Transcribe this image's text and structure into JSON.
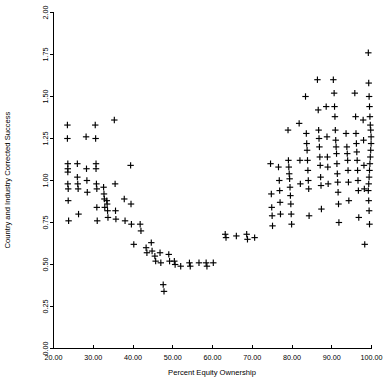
{
  "chart_data": {
    "type": "scatter",
    "title": "",
    "xlabel": "Percent Equity Ownership",
    "ylabel": "Country and Industry Corrected Success",
    "xlim": [
      20.0,
      100.0
    ],
    "ylim": [
      0.0,
      2.0
    ],
    "xticks": [
      20.0,
      30.0,
      40.0,
      50.0,
      60.0,
      70.0,
      80.0,
      90.0,
      100.0
    ],
    "yticks": [
      0.0,
      0.25,
      0.5,
      0.75,
      1.0,
      1.25,
      1.5,
      1.75,
      2.0
    ],
    "xtick_labels": [
      "20.00",
      "30.00",
      "40.00",
      "50.00",
      "60.00",
      "70.00",
      "80.00",
      "90.00",
      "100.00"
    ],
    "ytick_labels": [
      "0.00",
      "0.25",
      "0.50",
      "0.75",
      "1.00",
      "1.25",
      "1.50",
      "1.75",
      "2.00"
    ],
    "grid": false,
    "legend": null,
    "marker": "plus",
    "marker_color": "#000000",
    "points": [
      [
        23.5,
        1.33
      ],
      [
        23.5,
        1.25
      ],
      [
        23.6,
        1.1
      ],
      [
        23.6,
        1.07
      ],
      [
        23.6,
        1.05
      ],
      [
        23.6,
        0.98
      ],
      [
        23.7,
        0.95
      ],
      [
        23.7,
        0.88
      ],
      [
        23.8,
        0.76
      ],
      [
        26.0,
        1.1
      ],
      [
        26.0,
        1.02
      ],
      [
        26.1,
        0.98
      ],
      [
        26.2,
        0.95
      ],
      [
        26.3,
        0.8
      ],
      [
        28.2,
        1.26
      ],
      [
        28.3,
        1.07
      ],
      [
        28.4,
        1.0
      ],
      [
        28.5,
        0.93
      ],
      [
        30.5,
        1.33
      ],
      [
        30.6,
        1.25
      ],
      [
        30.7,
        1.1
      ],
      [
        30.7,
        1.07
      ],
      [
        30.8,
        0.98
      ],
      [
        30.9,
        0.95
      ],
      [
        30.9,
        0.84
      ],
      [
        31.0,
        0.76
      ],
      [
        32.6,
        0.96
      ],
      [
        32.7,
        0.92
      ],
      [
        32.8,
        0.89
      ],
      [
        32.9,
        0.84
      ],
      [
        33.4,
        0.88
      ],
      [
        33.5,
        0.86
      ],
      [
        33.6,
        0.82
      ],
      [
        33.7,
        0.78
      ],
      [
        35.3,
        1.36
      ],
      [
        35.5,
        0.98
      ],
      [
        35.6,
        0.82
      ],
      [
        35.7,
        0.77
      ],
      [
        37.8,
        0.89
      ],
      [
        38.0,
        0.76
      ],
      [
        39.4,
        1.09
      ],
      [
        39.5,
        0.86
      ],
      [
        39.6,
        0.74
      ],
      [
        40.2,
        0.62
      ],
      [
        41.8,
        0.74
      ],
      [
        42.0,
        0.7
      ],
      [
        43.3,
        0.6
      ],
      [
        43.5,
        0.57
      ],
      [
        44.6,
        0.63
      ],
      [
        44.8,
        0.58
      ],
      [
        45.5,
        0.55
      ],
      [
        45.7,
        0.52
      ],
      [
        46.8,
        0.57
      ],
      [
        47.0,
        0.51
      ],
      [
        47.6,
        0.38
      ],
      [
        47.8,
        0.34
      ],
      [
        49.0,
        0.56
      ],
      [
        49.2,
        0.52
      ],
      [
        50.4,
        0.52
      ],
      [
        50.6,
        0.5
      ],
      [
        52.0,
        0.49
      ],
      [
        54.2,
        0.51
      ],
      [
        54.4,
        0.49
      ],
      [
        56.6,
        0.51
      ],
      [
        58.4,
        0.51
      ],
      [
        58.6,
        0.49
      ],
      [
        60.2,
        0.51
      ],
      [
        63.2,
        0.68
      ],
      [
        63.4,
        0.66
      ],
      [
        66.0,
        0.67
      ],
      [
        68.6,
        0.68
      ],
      [
        68.8,
        0.65
      ],
      [
        70.6,
        0.66
      ],
      [
        74.6,
        1.1
      ],
      [
        74.8,
        0.92
      ],
      [
        74.9,
        0.84
      ],
      [
        75.0,
        0.79
      ],
      [
        75.1,
        0.73
      ],
      [
        76.6,
        1.08
      ],
      [
        76.8,
        1.0
      ],
      [
        76.9,
        0.94
      ],
      [
        77.0,
        0.87
      ],
      [
        77.1,
        0.8
      ],
      [
        79.0,
        1.3
      ],
      [
        79.1,
        1.12
      ],
      [
        79.2,
        1.08
      ],
      [
        79.3,
        1.04
      ],
      [
        79.4,
        1.01
      ],
      [
        79.5,
        0.96
      ],
      [
        79.6,
        0.91
      ],
      [
        79.7,
        0.86
      ],
      [
        79.8,
        0.8
      ],
      [
        79.9,
        0.74
      ],
      [
        81.8,
        1.34
      ],
      [
        82.0,
        1.12
      ],
      [
        82.1,
        0.98
      ],
      [
        83.4,
        1.5
      ],
      [
        83.6,
        1.28
      ],
      [
        83.7,
        1.22
      ],
      [
        83.8,
        1.18
      ],
      [
        83.9,
        1.12
      ],
      [
        84.0,
        1.06
      ],
      [
        84.1,
        1.0
      ],
      [
        84.2,
        0.95
      ],
      [
        84.3,
        0.79
      ],
      [
        86.4,
        1.6
      ],
      [
        86.6,
        1.42
      ],
      [
        86.7,
        1.3
      ],
      [
        86.8,
        1.25
      ],
      [
        86.9,
        1.2
      ],
      [
        87.0,
        1.14
      ],
      [
        87.1,
        1.09
      ],
      [
        87.2,
        1.02
      ],
      [
        87.3,
        0.97
      ],
      [
        87.4,
        0.83
      ],
      [
        88.6,
        1.44
      ],
      [
        88.8,
        1.26
      ],
      [
        88.9,
        1.14
      ],
      [
        89.0,
        1.08
      ],
      [
        89.1,
        0.98
      ],
      [
        90.4,
        1.6
      ],
      [
        90.6,
        1.52
      ],
      [
        90.7,
        1.44
      ],
      [
        90.8,
        1.38
      ],
      [
        90.9,
        1.3
      ],
      [
        91.0,
        1.24
      ],
      [
        91.1,
        1.2
      ],
      [
        91.2,
        1.16
      ],
      [
        91.3,
        1.1
      ],
      [
        91.4,
        1.04
      ],
      [
        91.5,
        0.99
      ],
      [
        91.6,
        0.93
      ],
      [
        91.7,
        0.86
      ],
      [
        91.8,
        0.75
      ],
      [
        93.6,
        1.28
      ],
      [
        93.8,
        1.2
      ],
      [
        93.9,
        1.16
      ],
      [
        94.0,
        1.12
      ],
      [
        94.1,
        1.06
      ],
      [
        94.2,
        0.99
      ],
      [
        94.3,
        0.88
      ],
      [
        95.8,
        1.52
      ],
      [
        96.0,
        1.38
      ],
      [
        96.1,
        1.28
      ],
      [
        96.2,
        1.22
      ],
      [
        96.3,
        1.17
      ],
      [
        96.4,
        1.12
      ],
      [
        96.5,
        1.06
      ],
      [
        96.6,
        1.0
      ],
      [
        96.7,
        0.94
      ],
      [
        96.8,
        0.78
      ],
      [
        97.9,
        1.36
      ],
      [
        98.0,
        1.24
      ],
      [
        98.1,
        1.09
      ],
      [
        98.2,
        0.95
      ],
      [
        98.3,
        0.62
      ],
      [
        99.2,
        1.76
      ],
      [
        99.3,
        1.58
      ],
      [
        99.4,
        1.5
      ],
      [
        99.5,
        1.44
      ],
      [
        99.6,
        1.38
      ],
      [
        99.7,
        1.33
      ],
      [
        99.8,
        1.3
      ],
      [
        99.9,
        1.26
      ],
      [
        99.9,
        1.22
      ],
      [
        99.8,
        1.18
      ],
      [
        99.7,
        1.14
      ],
      [
        99.6,
        1.1
      ],
      [
        99.5,
        1.06
      ],
      [
        99.4,
        1.02
      ],
      [
        99.3,
        0.98
      ],
      [
        99.2,
        0.94
      ],
      [
        99.3,
        0.88
      ],
      [
        99.4,
        0.82
      ],
      [
        99.5,
        0.74
      ]
    ],
    "n_points": 168
  },
  "axes": {
    "x_axis_name": "x-axis",
    "y_axis_name": "y-axis"
  }
}
